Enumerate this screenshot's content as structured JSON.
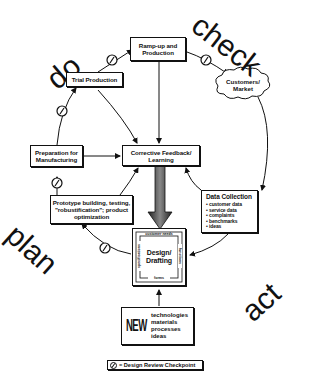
{
  "phases": {
    "do": "do",
    "check": "check",
    "plan": "plan",
    "act": "act"
  },
  "boxes": {
    "ramp_up": "Ramp-up and Production",
    "trial_production": "Trial Production",
    "customers_market": "Customers/ Market",
    "preparation": "Preparation for Manufacturing",
    "corrective_feedback": "Corrective Feedback/ Learning",
    "prototype": "Prototype building, testing, \"robustification\"; product optimization",
    "data_collection": {
      "title": "Data Collection",
      "items": [
        "customer data",
        "service data",
        "complaints",
        "benchmarks",
        "ideas"
      ]
    },
    "design_drafting": {
      "title": "Design/ Drafting",
      "top": "customer needs",
      "right": "functions",
      "bottom": "forms",
      "left": "specifications"
    },
    "new_block": {
      "word": "NEW",
      "items": [
        "technologies",
        "materials",
        "processes",
        "ideas"
      ]
    }
  },
  "legend": {
    "label": "= Design Review Checkpoint",
    "icon": "checkpoint-circle-icon"
  }
}
